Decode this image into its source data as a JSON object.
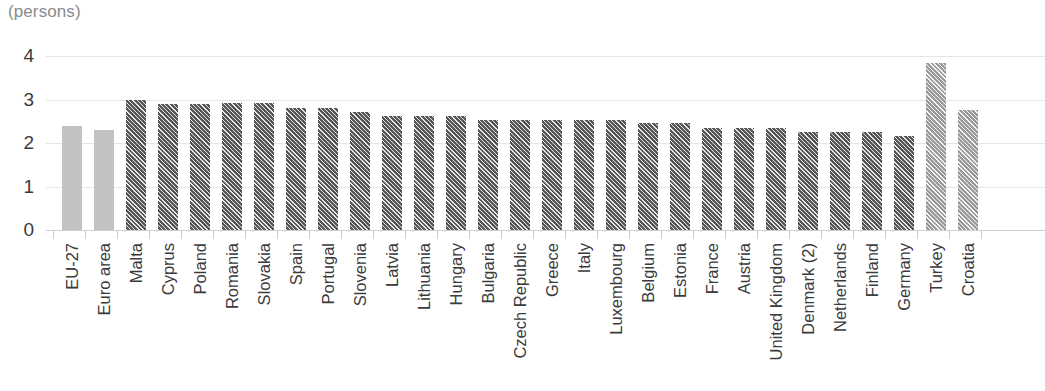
{
  "chart_data": {
    "type": "bar",
    "title": "",
    "unit_caption": "(persons)",
    "xlabel": "",
    "ylabel": "",
    "ylim": [
      0,
      4
    ],
    "yticks": [
      0,
      1,
      2,
      3,
      4
    ],
    "ytick_labels": [
      "0",
      "1",
      "2",
      "3",
      "4"
    ],
    "grid": true,
    "legend": "none",
    "categories": [
      "EU-27",
      "Euro area",
      "Malta",
      "Cyprus",
      "Poland",
      "Romania",
      "Slovakia",
      "Spain",
      "Portugal",
      "Slovenia",
      "Latvia",
      "Lithuania",
      "Hungary",
      "Bulgaria",
      "Czech Republic",
      "Greece",
      "Italy",
      "Luxembourg",
      "Belgium",
      "Estonia",
      "France",
      "Austria",
      "United Kingdom",
      "Denmark (2)",
      "Netherlands",
      "Finland",
      "Germany",
      "Turkey",
      "Croatia"
    ],
    "values": [
      2.4,
      2.3,
      3.0,
      2.9,
      2.9,
      2.91,
      2.92,
      2.8,
      2.8,
      2.72,
      2.62,
      2.62,
      2.62,
      2.53,
      2.52,
      2.52,
      2.53,
      2.53,
      2.45,
      2.45,
      2.34,
      2.34,
      2.35,
      2.25,
      2.25,
      2.25,
      2.16,
      3.85,
      2.75
    ],
    "styles": [
      "plain",
      "plain",
      "hatch-dark",
      "hatch-dark",
      "hatch-dark",
      "hatch-dark",
      "hatch-dark",
      "hatch-dark",
      "hatch-dark",
      "hatch-dark",
      "hatch-dark",
      "hatch-dark",
      "hatch-dark",
      "hatch-dark",
      "hatch-dark",
      "hatch-dark",
      "hatch-dark",
      "hatch-dark",
      "hatch-dark",
      "hatch-dark",
      "hatch-dark",
      "hatch-dark",
      "hatch-dark",
      "hatch-dark",
      "hatch-dark",
      "hatch-dark",
      "hatch-dark",
      "hatch-mid",
      "hatch-mid"
    ],
    "colors": {
      "aggregate_bar": "#c2c2c2",
      "member_state_bar": "#555555",
      "candidate_country_bar": "#9a9a9a",
      "gridline": "#e6e6e6",
      "axis": "#cfcfcf",
      "text": "#3b3b3b",
      "caption_text": "#8a8a8a"
    }
  }
}
